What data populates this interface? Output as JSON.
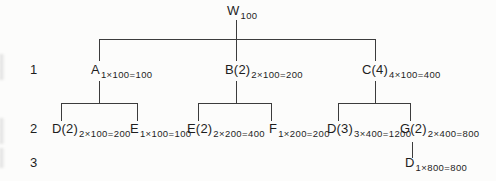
{
  "diagram_type": "tree",
  "colors": {
    "background": "#fcfcfb",
    "line": "#3c3c3c",
    "text": "#1e1e1e"
  },
  "level_labels": {
    "l1": "1",
    "l2": "2",
    "l3": "3"
  },
  "nodes": {
    "w": {
      "label": "W",
      "sub": "100"
    },
    "a": {
      "label": "A",
      "sub": "1×100=100"
    },
    "b2": {
      "label": "B(2)",
      "sub": "2×100=200"
    },
    "c4": {
      "label": "C(4)",
      "sub": "4×100=400"
    },
    "d2": {
      "label": "D(2)",
      "sub": "2×100=200"
    },
    "e": {
      "label": "E",
      "sub": "1×100=100"
    },
    "e2": {
      "label": "E(2)",
      "sub": "2×200=400"
    },
    "f": {
      "label": "F",
      "sub": "1×200=200"
    },
    "d3": {
      "label": "D(3)",
      "sub": "3×400=1200"
    },
    "g2": {
      "label": "G(2)",
      "sub": "2×400=800"
    },
    "d": {
      "label": "D",
      "sub": "1×800=800"
    }
  },
  "edges": [
    "W→A",
    "W→B(2)",
    "W→C(4)",
    "A→D(2)",
    "A→E",
    "B(2)→E(2)",
    "B(2)→F",
    "C(4)→D(3)",
    "C(4)→G(2)",
    "G(2)→D"
  ]
}
